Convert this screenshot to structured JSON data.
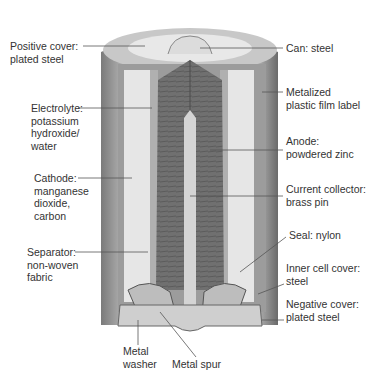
{
  "diagram": {
    "labels_left": [
      {
        "id": "positive-cover",
        "text": "Positive cover:\nplated steel",
        "x": 10,
        "y": 40
      },
      {
        "id": "electrolyte",
        "text": "Electrolyte:\npotassium\nhydroxide/\nwater",
        "x": 31,
        "y": 102
      },
      {
        "id": "cathode",
        "text": "Cathode:\nmanganese\ndioxide,\ncarbon",
        "x": 34,
        "y": 172
      },
      {
        "id": "separator",
        "text": "Separator:\nnon-woven\nfabric",
        "x": 27,
        "y": 246
      }
    ],
    "labels_right": [
      {
        "id": "can",
        "text": "Can: steel",
        "x": 286,
        "y": 42
      },
      {
        "id": "label",
        "text": "Metalized\nplastic film label",
        "x": 286,
        "y": 86
      },
      {
        "id": "anode",
        "text": "Anode:\npowdered zinc",
        "x": 286,
        "y": 135
      },
      {
        "id": "current-collector",
        "text": "Current collector:\nbrass pin",
        "x": 286,
        "y": 183
      },
      {
        "id": "seal",
        "text": "Seal: nylon",
        "x": 289,
        "y": 229
      },
      {
        "id": "inner-cell-cover",
        "text": "Inner cell cover:\nsteel",
        "x": 286,
        "y": 262
      },
      {
        "id": "negative-cover",
        "text": "Negative cover:\nplated steel",
        "x": 286,
        "y": 298
      }
    ],
    "labels_bottom": [
      {
        "id": "metal-washer",
        "text": "Metal\nwasher",
        "x": 123,
        "y": 345
      },
      {
        "id": "metal-spur",
        "text": "Metal spur",
        "x": 172,
        "y": 358
      }
    ],
    "colors": {
      "can_outer": "#8a8a8a",
      "can_light": "#bdbdbd",
      "cathode": "#e4e4e4",
      "anode": "#6e6e6e",
      "pin": "#d6d6d6",
      "line": "#555555"
    }
  }
}
